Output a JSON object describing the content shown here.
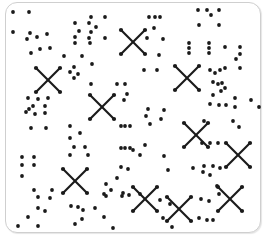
{
  "figure": {
    "width": 266,
    "height": 238,
    "ink_color": "#1a1a1a",
    "frame_color": "#cfcfcf",
    "dot_radius": 1.9,
    "dots": [
      [
        13,
        12
      ],
      [
        29,
        12
      ],
      [
        13,
        32
      ],
      [
        30,
        33
      ],
      [
        27,
        39
      ],
      [
        37,
        37
      ],
      [
        47,
        34
      ],
      [
        31,
        53
      ],
      [
        40,
        49
      ],
      [
        50,
        48
      ],
      [
        75,
        23
      ],
      [
        91,
        17
      ],
      [
        105,
        17
      ],
      [
        89,
        23
      ],
      [
        96,
        27
      ],
      [
        91,
        32
      ],
      [
        79,
        31
      ],
      [
        75,
        37
      ],
      [
        89,
        38
      ],
      [
        105,
        38
      ],
      [
        75,
        43
      ],
      [
        90,
        43
      ],
      [
        64,
        56
      ],
      [
        82,
        56
      ],
      [
        92,
        64
      ],
      [
        91,
        84
      ],
      [
        117,
        84
      ],
      [
        125,
        84
      ],
      [
        127,
        94
      ],
      [
        124,
        100
      ],
      [
        74,
        67
      ],
      [
        70,
        72
      ],
      [
        78,
        74
      ],
      [
        74,
        78
      ],
      [
        28,
        98
      ],
      [
        38,
        99
      ],
      [
        48,
        98
      ],
      [
        29,
        109
      ],
      [
        33,
        106
      ],
      [
        45,
        106
      ],
      [
        26,
        112
      ],
      [
        35,
        114
      ],
      [
        45,
        113
      ],
      [
        149,
        17
      ],
      [
        155,
        17
      ],
      [
        160,
        17
      ],
      [
        198,
        10
      ],
      [
        207,
        10
      ],
      [
        211,
        15
      ],
      [
        219,
        10
      ],
      [
        199,
        25
      ],
      [
        219,
        25
      ],
      [
        154,
        28
      ],
      [
        147,
        38
      ],
      [
        163,
        39
      ],
      [
        159,
        55
      ],
      [
        144,
        70
      ],
      [
        157,
        70
      ],
      [
        189,
        43
      ],
      [
        189,
        48
      ],
      [
        189,
        53
      ],
      [
        209,
        43
      ],
      [
        209,
        48
      ],
      [
        209,
        53
      ],
      [
        225,
        47
      ],
      [
        240,
        47
      ],
      [
        240,
        54
      ],
      [
        236,
        59
      ],
      [
        240,
        68
      ],
      [
        225,
        68
      ],
      [
        210,
        70
      ],
      [
        215,
        73
      ],
      [
        220,
        70
      ],
      [
        213,
        82
      ],
      [
        218,
        84
      ],
      [
        222,
        83
      ],
      [
        225,
        88
      ],
      [
        221,
        91
      ],
      [
        213,
        95
      ],
      [
        210,
        104
      ],
      [
        219,
        105
      ],
      [
        226,
        105
      ],
      [
        235,
        98
      ],
      [
        235,
        107
      ],
      [
        251,
        100
      ],
      [
        259,
        107
      ],
      [
        31,
        128
      ],
      [
        46,
        128
      ],
      [
        70,
        126
      ],
      [
        80,
        133
      ],
      [
        70,
        138
      ],
      [
        74,
        147
      ],
      [
        85,
        147
      ],
      [
        70,
        155
      ],
      [
        88,
        155
      ],
      [
        121,
        126
      ],
      [
        125,
        126
      ],
      [
        130,
        126
      ],
      [
        121,
        148
      ],
      [
        125,
        148
      ],
      [
        130,
        148
      ],
      [
        22,
        157
      ],
      [
        34,
        157
      ],
      [
        22,
        165
      ],
      [
        34,
        165
      ],
      [
        22,
        176
      ],
      [
        34,
        190
      ],
      [
        38,
        197
      ],
      [
        52,
        190
      ],
      [
        50,
        198
      ],
      [
        38,
        208
      ],
      [
        45,
        211
      ],
      [
        28,
        217
      ],
      [
        18,
        226
      ],
      [
        38,
        226
      ],
      [
        71,
        206
      ],
      [
        78,
        207
      ],
      [
        83,
        210
      ],
      [
        95,
        208
      ],
      [
        82,
        219
      ],
      [
        75,
        224
      ],
      [
        104,
        217
      ],
      [
        113,
        228
      ],
      [
        121,
        167
      ],
      [
        117,
        178
      ],
      [
        106,
        184
      ],
      [
        111,
        190
      ],
      [
        123,
        193
      ],
      [
        106,
        196
      ],
      [
        128,
        169
      ],
      [
        104,
        194
      ],
      [
        122,
        196
      ],
      [
        129,
        195
      ],
      [
        140,
        194
      ],
      [
        160,
        200
      ],
      [
        163,
        218
      ],
      [
        172,
        227
      ],
      [
        148,
        109
      ],
      [
        146,
        116
      ],
      [
        161,
        119
      ],
      [
        150,
        124
      ],
      [
        164,
        110
      ],
      [
        145,
        145
      ],
      [
        140,
        155
      ],
      [
        133,
        150
      ],
      [
        164,
        156
      ],
      [
        168,
        170
      ],
      [
        204,
        121
      ],
      [
        233,
        121
      ],
      [
        239,
        127
      ],
      [
        202,
        143
      ],
      [
        210,
        143
      ],
      [
        218,
        143
      ],
      [
        193,
        168
      ],
      [
        204,
        166
      ],
      [
        213,
        166
      ],
      [
        220,
        168
      ],
      [
        203,
        172
      ],
      [
        210,
        175
      ],
      [
        217,
        186
      ],
      [
        219,
        194
      ],
      [
        209,
        201
      ],
      [
        201,
        199
      ],
      [
        199,
        218
      ],
      [
        207,
        220
      ],
      [
        213,
        220
      ],
      [
        170,
        204
      ]
    ],
    "crosses": [
      {
        "cx": 48,
        "cy": 80,
        "r": 12
      },
      {
        "cx": 102,
        "cy": 107,
        "r": 12
      },
      {
        "cx": 133,
        "cy": 42,
        "r": 12
      },
      {
        "cx": 187,
        "cy": 78,
        "r": 12
      },
      {
        "cx": 75,
        "cy": 181,
        "r": 12
      },
      {
        "cx": 196,
        "cy": 135,
        "r": 12
      },
      {
        "cx": 238,
        "cy": 155,
        "r": 12
      },
      {
        "cx": 145,
        "cy": 199,
        "r": 12
      },
      {
        "cx": 179,
        "cy": 209,
        "r": 12
      },
      {
        "cx": 230,
        "cy": 199,
        "r": 12
      }
    ]
  }
}
